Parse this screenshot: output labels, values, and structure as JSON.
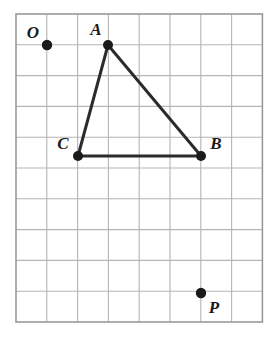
{
  "figure": {
    "kind": "geometry-grid-figure",
    "width": 277,
    "height": 346,
    "background_color": "#ffffff"
  },
  "grid": {
    "columns": 8,
    "rows": 10,
    "cell_size": 30.8,
    "origin_x": 16,
    "origin_y": 14,
    "line_color": "#b5b5b5",
    "border_color": "#9a9a9a",
    "line_width": 1.1,
    "border_width": 1.6
  },
  "style": {
    "edge_color": "#2b2b2b",
    "edge_width": 3.0,
    "vertex_dot_color": "#1a1a1a",
    "vertex_dot_radius": 5.0,
    "point_dot_radius": 5.2,
    "label_color": "#1a1a1a",
    "label_font_size": 17
  },
  "points": [
    {
      "id": "O",
      "label": "O",
      "grid_col": 1.0,
      "grid_row": 1.0,
      "x": 47,
      "y": 45,
      "label_x": 33,
      "label_y": 38,
      "label_anchor": "middle",
      "role": "marked-point",
      "is_triangle_vertex": false
    },
    {
      "id": "A",
      "label": "A",
      "grid_col": 3.0,
      "grid_row": 1.0,
      "x": 108,
      "y": 45,
      "label_x": 96,
      "label_y": 35,
      "label_anchor": "middle",
      "role": "triangle-vertex",
      "is_triangle_vertex": true
    },
    {
      "id": "B",
      "label": "B",
      "grid_col": 6.0,
      "grid_row": 4.6,
      "x": 201,
      "y": 156,
      "label_x": 216,
      "label_y": 149,
      "label_anchor": "middle",
      "role": "triangle-vertex",
      "is_triangle_vertex": true
    },
    {
      "id": "C",
      "label": "C",
      "grid_col": 2.0,
      "grid_row": 4.6,
      "x": 78,
      "y": 156,
      "label_x": 63,
      "label_y": 149,
      "label_anchor": "middle",
      "role": "triangle-vertex",
      "is_triangle_vertex": true
    },
    {
      "id": "P",
      "label": "P",
      "grid_col": 6.0,
      "grid_row": 9.05,
      "x": 201,
      "y": 293,
      "label_x": 214,
      "label_y": 313,
      "label_anchor": "middle",
      "role": "marked-point",
      "is_triangle_vertex": false
    }
  ],
  "triangle": {
    "name": "ABC",
    "vertex_ids": [
      "A",
      "B",
      "C"
    ],
    "closed": true,
    "edges": [
      {
        "id": "AB",
        "from": "A",
        "to": "B"
      },
      {
        "id": "BC",
        "from": "B",
        "to": "C"
      },
      {
        "id": "CA",
        "from": "C",
        "to": "A"
      }
    ]
  },
  "chart_data": {
    "type": "scatter",
    "title": "",
    "xlabel": "",
    "ylabel": "",
    "grid": true,
    "legend": "none",
    "xlim": [
      0,
      8
    ],
    "ylim": [
      0,
      10
    ],
    "x": [
      1,
      3,
      6,
      2,
      6
    ],
    "y": [
      1,
      1,
      4.6,
      4.6,
      9.05
    ],
    "labels": [
      "O",
      "A",
      "B",
      "C",
      "P"
    ],
    "annotations": [
      "Triangle ABC connects A(3,1), B(6,4.6), C(2,4.6)",
      "Segment CB is horizontal and spans 4 grid cells",
      "Point O is isolated at grid intersection (1,1)",
      "Point P is isolated near grid column 6, row 9"
    ]
  }
}
